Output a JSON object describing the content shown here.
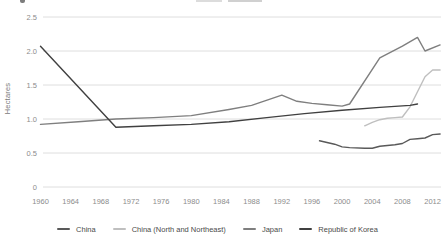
{
  "chart_data": {
    "type": "line",
    "title": "",
    "xlabel": "",
    "ylabel": "Hectares",
    "ylim": [
      0,
      2.5
    ],
    "xlim": [
      1960,
      2014
    ],
    "grid": "horizontal",
    "legend_position": "bottom",
    "y_ticks": [
      "2.5",
      "2.0",
      "1.5",
      "1.0",
      "0.5",
      "0"
    ],
    "x_ticks": [
      1960,
      1964,
      1968,
      1972,
      1976,
      1980,
      1984,
      1988,
      1992,
      1996,
      2000,
      2004,
      2008,
      2012
    ],
    "tick_label_color": "#8c8c8c",
    "gridline_color": "#dedede",
    "series": [
      {
        "name": "China",
        "color": "#595959",
        "points": [
          [
            1997,
            0.68
          ],
          [
            1999,
            0.63
          ],
          [
            2000,
            0.59
          ],
          [
            2001,
            0.58
          ],
          [
            2003,
            0.57
          ],
          [
            2004,
            0.57
          ],
          [
            2005,
            0.6
          ],
          [
            2007,
            0.62
          ],
          [
            2008,
            0.64
          ],
          [
            2009,
            0.7
          ],
          [
            2010,
            0.71
          ],
          [
            2011,
            0.72
          ],
          [
            2012,
            0.77
          ],
          [
            2013,
            0.78
          ]
        ]
      },
      {
        "name": "China (North and Northeast)",
        "color": "#bfbfbf",
        "points": [
          [
            2003,
            0.9
          ],
          [
            2004,
            0.95
          ],
          [
            2005,
            0.99
          ],
          [
            2006,
            1.01
          ],
          [
            2007,
            1.02
          ],
          [
            2008,
            1.03
          ],
          [
            2009,
            1.18
          ],
          [
            2010,
            1.4
          ],
          [
            2011,
            1.62
          ],
          [
            2012,
            1.72
          ],
          [
            2013,
            1.72
          ]
        ]
      },
      {
        "name": "Japan",
        "color": "#7f7f7f",
        "points": [
          [
            1960,
            0.92
          ],
          [
            1965,
            0.96
          ],
          [
            1970,
            1.0
          ],
          [
            1975,
            1.02
          ],
          [
            1980,
            1.05
          ],
          [
            1985,
            1.14
          ],
          [
            1988,
            1.2
          ],
          [
            1992,
            1.35
          ],
          [
            1994,
            1.26
          ],
          [
            1996,
            1.23
          ],
          [
            1998,
            1.21
          ],
          [
            2000,
            1.19
          ],
          [
            2001,
            1.22
          ],
          [
            2005,
            1.9
          ],
          [
            2008,
            2.07
          ],
          [
            2010,
            2.2
          ],
          [
            2011,
            2.0
          ],
          [
            2013,
            2.09
          ]
        ]
      },
      {
        "name": "Republic of Korea",
        "color": "#404040",
        "points": [
          [
            1960,
            2.07
          ],
          [
            1970,
            0.88
          ],
          [
            1975,
            0.9
          ],
          [
            1980,
            0.92
          ],
          [
            1985,
            0.96
          ],
          [
            1990,
            1.02
          ],
          [
            1995,
            1.08
          ],
          [
            2000,
            1.13
          ],
          [
            2005,
            1.17
          ],
          [
            2009,
            1.2
          ],
          [
            2010,
            1.22
          ]
        ]
      }
    ]
  }
}
